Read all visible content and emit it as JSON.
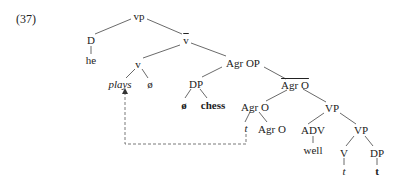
{
  "example_number": "(37)",
  "tree": {
    "nodes": {
      "vp": "vp",
      "D": "D",
      "he": "he",
      "vbar": "v",
      "v": "v",
      "plays": "plays",
      "phi_v": "ø",
      "AgrOP": "Agr OP",
      "DP_obj": "DP",
      "null_det": "ø",
      "chess": "chess",
      "AgrObar": "Agr O",
      "AgrO_head": "Agr O",
      "t_v": "t",
      "AgrO_inner": "Agr O",
      "VP_upper": "VP",
      "ADV": "ADV",
      "well": "well",
      "VP_lower": "VP",
      "V": "V",
      "t_V": "t",
      "DP_trace": "DP",
      "t_DP": "t"
    },
    "movement_arrow": {
      "from": "t",
      "to": "plays",
      "style": "dashed"
    }
  }
}
